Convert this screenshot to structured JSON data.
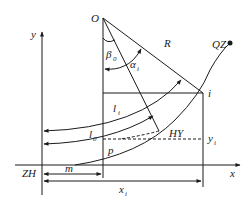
{
  "diagram": {
    "type": "transition-curve-geometry",
    "axes": {
      "x_label": "x",
      "y_label": "y",
      "origin_label": "ZH"
    },
    "points": {
      "center": "O",
      "point_i": "i",
      "spiral_circle_point": "HY",
      "end_point": "QZ"
    },
    "angles": {
      "beta": "β",
      "beta_sub": "0",
      "alpha": "α",
      "alpha_sub": "i"
    },
    "lengths": {
      "radius": "R",
      "l_i": "l",
      "l_i_sub": "i",
      "l_0": "l",
      "l_0_sub": "0",
      "p": "p",
      "m": "m",
      "x_i": "x",
      "x_i_sub": "i",
      "y_i": "y",
      "y_i_sub": "i"
    },
    "colors": {
      "stroke": "#1a1a1a",
      "background": "#ffffff"
    }
  }
}
